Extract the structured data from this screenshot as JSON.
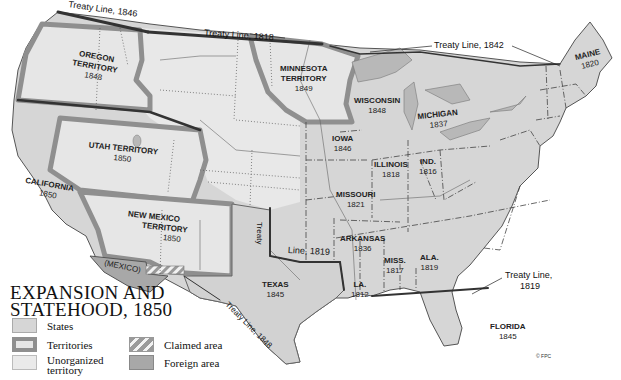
{
  "title_line1": "EXPANSION AND",
  "title_line2": "STATEHOOD, 1850",
  "legend": [
    {
      "id": "states",
      "label": "States",
      "color": "#d6d6d6"
    },
    {
      "id": "territories",
      "label": "Territories",
      "color": "#e6e6e6",
      "border": "#8f8f8f"
    },
    {
      "id": "unorganized",
      "label_line1": "Unorganized",
      "label_line2": "territory",
      "color": "#eaeaea"
    },
    {
      "id": "claimed",
      "label": "Claimed area",
      "pattern": "hatched"
    },
    {
      "id": "foreign",
      "label": "Foreign area",
      "color": "#a8a8a8"
    }
  ],
  "treaty_lines": [
    {
      "label": "Treaty Line, 1846"
    },
    {
      "label": "Treaty Line, 1818"
    },
    {
      "label": "Treaty Line, 1842"
    },
    {
      "label_a": "Treaty",
      "label_b": "Line, 1819"
    },
    {
      "label_line1": "Treaty Line,",
      "label_line2": "1819"
    },
    {
      "label": "Treaty Line, 1848"
    }
  ],
  "territories": [
    {
      "name_line1": "OREGON",
      "name_line2": "TERRITORY",
      "year": "1848"
    },
    {
      "name_line1": "MINNESOTA",
      "name_line2": "TERRITORY",
      "year": "1849"
    },
    {
      "name": "UTAH TERRITORY",
      "year": "1850"
    },
    {
      "name_line1": "NEW MEXICO",
      "name_line2": "TERRITORY",
      "year": "1850"
    }
  ],
  "states": [
    {
      "name": "CALIFORNIA",
      "year": "1850"
    },
    {
      "name": "TEXAS",
      "year": "1845"
    },
    {
      "name": "IOWA",
      "year": "1846"
    },
    {
      "name": "MISSOURI",
      "year": "1821"
    },
    {
      "name": "ARKANSAS",
      "year": "1836"
    },
    {
      "name": "LA.",
      "year": "1812"
    },
    {
      "name": "ILLINOIS",
      "year": "1818"
    },
    {
      "name": "IND.",
      "year": "1816"
    },
    {
      "name": "MISS.",
      "year": "1817"
    },
    {
      "name": "ALA.",
      "year": "1819"
    },
    {
      "name": "WISCONSIN",
      "year": "1848"
    },
    {
      "name": "MICHIGAN",
      "year": "1837"
    },
    {
      "name": "MAINE",
      "year": "1820"
    },
    {
      "name": "FLORIDA",
      "year": "1845"
    }
  ],
  "foreign": {
    "name": "(MEXICO)"
  },
  "copyright": "© FPC",
  "colors": {
    "states": "#d6d6d6",
    "territory_fill": "#e6e6e6",
    "territory_border": "#8f8f8f",
    "foreign": "#a8a8a8",
    "water": "#b8b8b8",
    "treaty_line": "#333333"
  }
}
